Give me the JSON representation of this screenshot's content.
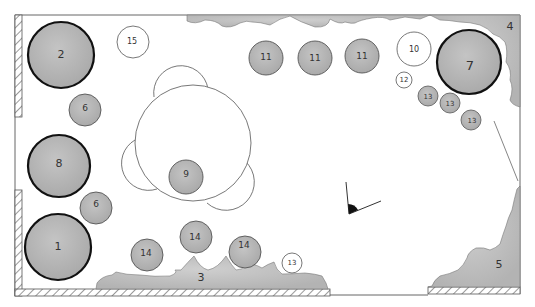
{
  "diagram": {
    "type": "garden-planting-plan",
    "border_color": "#555555",
    "shade_fill": "#b8b8b8",
    "shade_fill_light": "#d0d0d0",
    "outline_color": "#222222"
  },
  "beds": [
    {
      "id": "bed-3",
      "label": "3",
      "x": 201,
      "y": 277
    },
    {
      "id": "bed-4",
      "label": "4",
      "x": 510,
      "y": 26
    },
    {
      "id": "bed-5",
      "label": "5",
      "x": 499,
      "y": 264
    }
  ],
  "plants": [
    {
      "label": "2",
      "cx": 61,
      "cy": 55,
      "r": 33,
      "style": "large-dark"
    },
    {
      "label": "8",
      "cx": 59,
      "cy": 166,
      "r": 31,
      "style": "large-dark"
    },
    {
      "label": "1",
      "cx": 58,
      "cy": 247,
      "r": 33,
      "style": "large-dark"
    },
    {
      "label": "7",
      "cx": 469,
      "cy": 62,
      "r": 32,
      "style": "large-dark"
    },
    {
      "label": "6",
      "cx": 85,
      "cy": 110,
      "r": 16,
      "style": "medium"
    },
    {
      "label": "6",
      "cx": 96,
      "cy": 208,
      "r": 16,
      "style": "medium"
    },
    {
      "label": "9",
      "cx": 186,
      "cy": 177,
      "r": 17,
      "style": "medium"
    },
    {
      "label": "11",
      "cx": 266,
      "cy": 58,
      "r": 17,
      "style": "medium"
    },
    {
      "label": "11",
      "cx": 315,
      "cy": 58,
      "r": 17,
      "style": "medium"
    },
    {
      "label": "11",
      "cx": 362,
      "cy": 56,
      "r": 17,
      "style": "medium"
    },
    {
      "label": "14",
      "cx": 147,
      "cy": 255,
      "r": 16,
      "style": "medium"
    },
    {
      "label": "14",
      "cx": 196,
      "cy": 237,
      "r": 16,
      "style": "medium"
    },
    {
      "label": "14",
      "cx": 245,
      "cy": 252,
      "r": 16,
      "style": "medium"
    },
    {
      "label": "13",
      "cx": 428,
      "cy": 96,
      "r": 10,
      "style": "small"
    },
    {
      "label": "13",
      "cx": 450,
      "cy": 103,
      "r": 10,
      "style": "small"
    },
    {
      "label": "13",
      "cx": 471,
      "cy": 120,
      "r": 10,
      "style": "small"
    },
    {
      "label": "15",
      "cx": 133,
      "cy": 42,
      "r": 16,
      "style": "outline"
    },
    {
      "label": "10",
      "cx": 414,
      "cy": 49,
      "r": 17,
      "style": "outline"
    },
    {
      "label": "12",
      "cx": 404,
      "cy": 80,
      "r": 8,
      "style": "outline"
    },
    {
      "label": "13",
      "cx": 292,
      "cy": 263,
      "r": 10,
      "style": "outline"
    }
  ],
  "seating_area": {
    "main": {
      "cx": 193,
      "cy": 141,
      "r": 58
    },
    "chairs": [
      {
        "cx": 180,
        "cy": 89,
        "r": 27
      },
      {
        "cx": 144,
        "cy": 165,
        "r": 27
      },
      {
        "cx": 232,
        "cy": 183,
        "r": 27
      }
    ]
  },
  "viewpoint": {
    "x": 349,
    "y": 213,
    "label": "view-angle-marker"
  }
}
